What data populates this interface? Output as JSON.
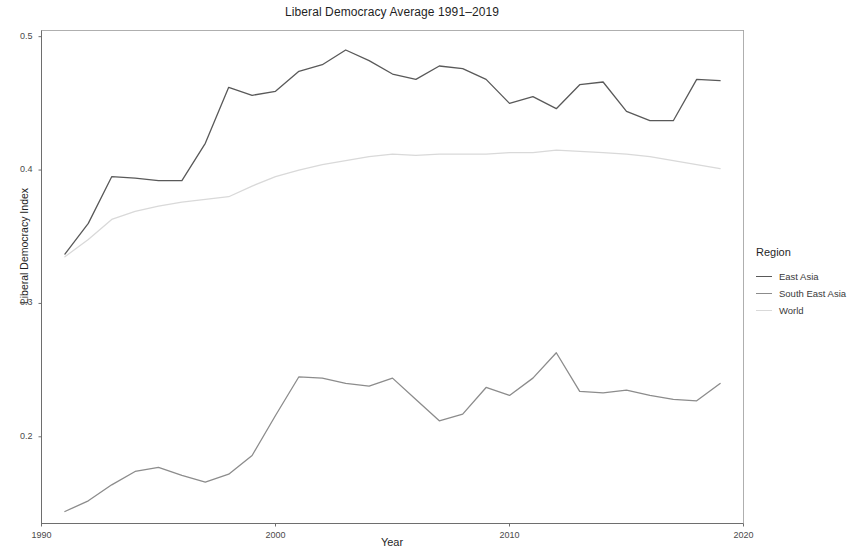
{
  "chart_data": {
    "type": "line",
    "title": "Liberal Democracy Average 1991–2019",
    "xlabel": "Year",
    "ylabel": "Liberal Democracy Index",
    "xlim": [
      1990,
      2020
    ],
    "ylim": [
      0.135,
      0.505
    ],
    "xticks": [
      1990,
      2000,
      2010,
      2020
    ],
    "xtick_labels": [
      "1990",
      "2000",
      "2010",
      "2020"
    ],
    "yticks": [
      0.2,
      0.3,
      0.4,
      0.5
    ],
    "ytick_labels": [
      "0.2",
      "0.3",
      "0.4",
      "0.5"
    ],
    "grid": false,
    "legend_position": "right",
    "legend_title": "Region",
    "x": [
      1991,
      1992,
      1993,
      1994,
      1995,
      1996,
      1997,
      1998,
      1999,
      2000,
      2001,
      2002,
      2003,
      2004,
      2005,
      2006,
      2007,
      2008,
      2009,
      2010,
      2011,
      2012,
      2013,
      2014,
      2015,
      2016,
      2017,
      2018,
      2019
    ],
    "series": [
      {
        "name": "East Asia",
        "color": "#595959",
        "values": [
          0.337,
          0.36,
          0.395,
          0.394,
          0.392,
          0.392,
          0.42,
          0.462,
          0.456,
          0.459,
          0.474,
          0.479,
          0.49,
          0.482,
          0.472,
          0.468,
          0.478,
          0.476,
          0.468,
          0.45,
          0.455,
          0.446,
          0.464,
          0.466,
          0.444,
          0.437,
          0.437,
          0.468,
          0.467
        ]
      },
      {
        "name": "South East Asia",
        "color": "#8c8c8c",
        "values": [
          0.144,
          0.152,
          0.164,
          0.174,
          0.177,
          0.171,
          0.166,
          0.172,
          0.186,
          0.216,
          0.245,
          0.244,
          0.24,
          0.238,
          0.244,
          0.228,
          0.212,
          0.217,
          0.237,
          0.231,
          0.244,
          0.263,
          0.234,
          0.233,
          0.235,
          0.231,
          0.228,
          0.227,
          0.24
        ]
      },
      {
        "name": "World",
        "color": "#d9d9d9",
        "values": [
          0.335,
          0.348,
          0.363,
          0.369,
          0.373,
          0.376,
          0.378,
          0.38,
          0.388,
          0.395,
          0.4,
          0.404,
          0.407,
          0.41,
          0.412,
          0.411,
          0.412,
          0.412,
          0.412,
          0.413,
          0.413,
          0.415,
          0.414,
          0.413,
          0.412,
          0.41,
          0.407,
          0.404,
          0.401
        ]
      }
    ]
  },
  "legend": {
    "title": "Region",
    "items": [
      {
        "label": "East Asia"
      },
      {
        "label": "South East Asia"
      },
      {
        "label": "World"
      }
    ]
  }
}
